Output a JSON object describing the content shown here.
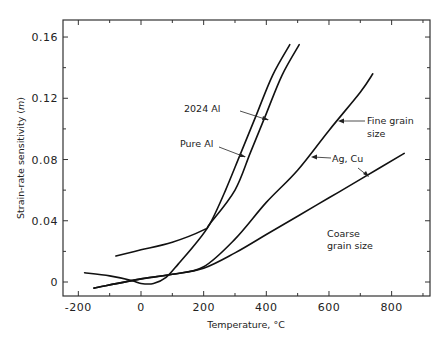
{
  "chart_data": {
    "type": "line",
    "title": "",
    "xlabel": "Temperature, °C",
    "ylabel": "Strain-rate sensitivity (m)",
    "xlim": [
      -250,
      920
    ],
    "ylim": [
      -0.009,
      0.172
    ],
    "x_ticks": [
      -200,
      0,
      200,
      400,
      600,
      800
    ],
    "x_tick_labels": [
      "-200",
      "0",
      "200",
      "400",
      "600",
      "800"
    ],
    "y_ticks": [
      0,
      0.04,
      0.08,
      0.12,
      0.16
    ],
    "y_tick_labels": [
      "0",
      "0.04",
      "0.08",
      "0.12",
      "0.16"
    ],
    "grid": false,
    "legend": null,
    "series": [
      {
        "name": "2024 Al",
        "x": [
          -180,
          -100,
          -30,
          0,
          40,
          80,
          120,
          170,
          220,
          270,
          320,
          370,
          420,
          475
        ],
        "y": [
          0.006,
          0.004,
          0.001,
          -0.001,
          -0.001,
          0.003,
          0.012,
          0.024,
          0.038,
          0.06,
          0.085,
          0.11,
          0.135,
          0.155
        ]
      },
      {
        "name": "Pure Al",
        "x": [
          -80,
          0,
          100,
          200,
          220,
          300,
          350,
          400,
          450,
          505
        ],
        "y": [
          0.017,
          0.021,
          0.026,
          0.034,
          0.038,
          0.06,
          0.085,
          0.11,
          0.135,
          0.155
        ]
      },
      {
        "name": "Ag, Cu - Fine grain size",
        "x": [
          -150,
          0,
          100,
          200,
          300,
          400,
          500,
          600,
          700,
          740
        ],
        "y": [
          -0.004,
          0.002,
          0.005,
          0.01,
          0.028,
          0.052,
          0.073,
          0.099,
          0.124,
          0.136
        ]
      },
      {
        "name": "Ag, Cu - Coarse grain size",
        "x": [
          -150,
          0,
          100,
          200,
          300,
          400,
          500,
          600,
          700,
          840
        ],
        "y": [
          -0.004,
          0.002,
          0.005,
          0.009,
          0.019,
          0.031,
          0.043,
          0.055,
          0.067,
          0.084
        ]
      }
    ],
    "annotations": [
      {
        "text": "2024 Al",
        "points_to": "2024 Al"
      },
      {
        "text": "Pure Al",
        "points_to": "Pure Al"
      },
      {
        "text": "Fine grain",
        "text2": "size",
        "points_to": "Ag, Cu - Fine grain size"
      },
      {
        "text": "Ag, Cu",
        "points_to": [
          "Ag, Cu - Fine grain size",
          "Ag, Cu - Coarse grain size"
        ]
      },
      {
        "text": "Coarse",
        "text2": "grain size",
        "points_to": "Ag, Cu - Coarse grain size"
      }
    ]
  },
  "labels": {
    "xlabel": "Temperature, °C",
    "ylabel_main": "Strain-rate sensitivity (",
    "ylabel_m": "m",
    "ylabel_close": ")",
    "annot_2024": "2024 Al",
    "annot_pure": "Pure Al",
    "annot_fine_1": "Fine grain",
    "annot_fine_2": "size",
    "annot_agcu": "Ag, Cu",
    "annot_coarse_1": "Coarse",
    "annot_coarse_2": "grain size"
  },
  "style": {
    "line_color": "#111111",
    "axis_color": "#333333"
  }
}
